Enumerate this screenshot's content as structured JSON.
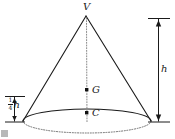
{
  "figure": {
    "type": "geometry-diagram",
    "background_color": "#ffffff",
    "stroke_color": "#1a1a1a",
    "labels": {
      "apex": "V",
      "centroid": "G",
      "base_center": "C",
      "height": "h",
      "quarter_height_numerator": "1",
      "quarter_height_denominator": "4",
      "quarter_height_symbol": "h"
    },
    "geometry": {
      "apex_point": [
        86,
        15
      ],
      "base_center_point": [
        87,
        121
      ],
      "base_ellipse_rx": 64,
      "base_ellipse_ry": 12,
      "centroid_point": [
        87,
        90
      ],
      "height_dimension_x": 158,
      "height_dimension_top_y": 18,
      "height_dimension_bottom_y": 122,
      "quarter_dimension_x": 14,
      "quarter_dimension_top_y": 96,
      "quarter_dimension_bottom_y": 122
    }
  }
}
